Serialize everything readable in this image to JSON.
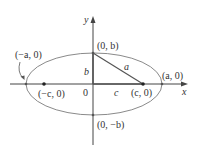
{
  "diagram": {
    "type": "ellipse-with-foci",
    "colors": {
      "ellipse": "#8a8a8a",
      "axes": "#444444",
      "triangle": "#555555",
      "text": "#333333"
    },
    "axes": {
      "x_label": "x",
      "y_label": "y",
      "origin_label": "0"
    },
    "points": {
      "top_vertex": "(0, b)",
      "bottom_vertex": "(0, −b)",
      "right_vertex": "(a, 0)",
      "left_vertex": "(−a, 0)",
      "right_focus": "(c, 0)",
      "left_focus": "(−c, 0)"
    },
    "segments": {
      "vertical_leg": "b",
      "horizontal_leg": "c",
      "hypotenuse": "a"
    }
  }
}
